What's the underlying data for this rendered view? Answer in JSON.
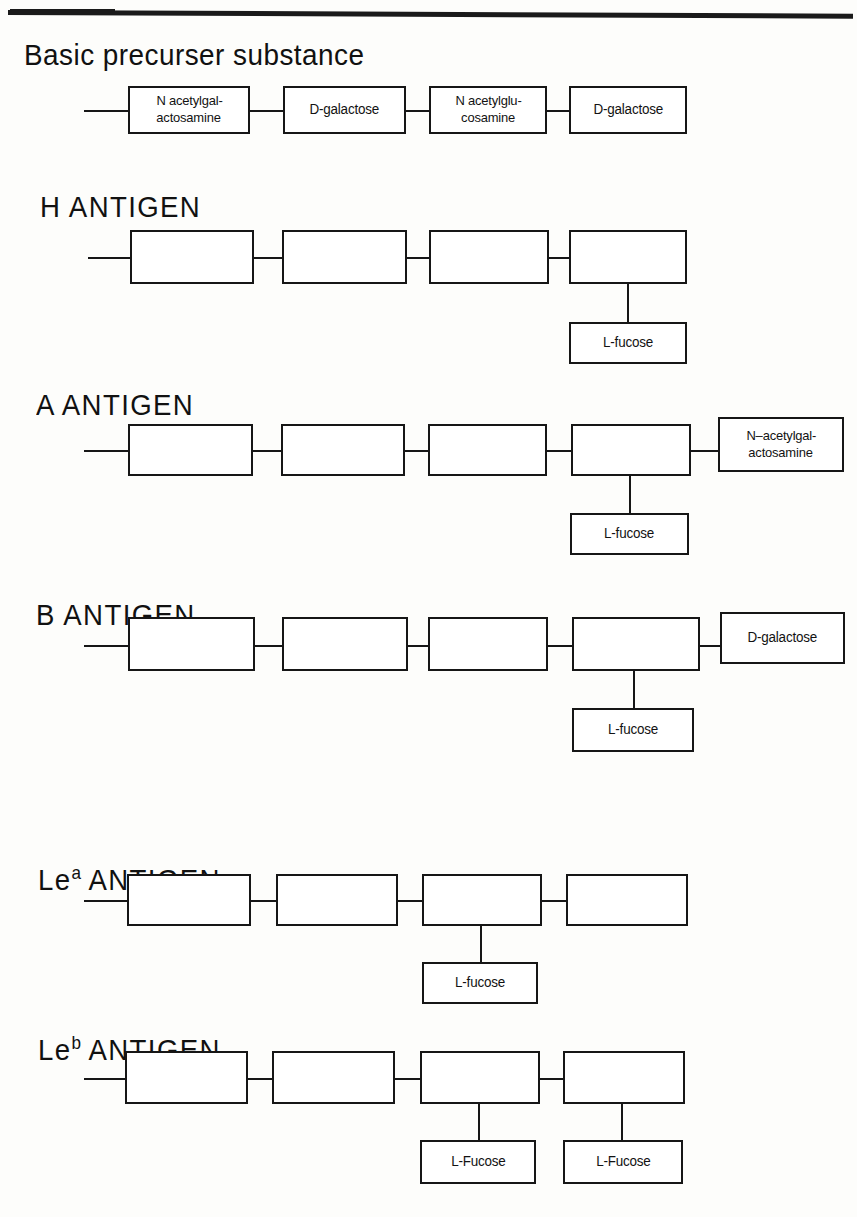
{
  "document": {
    "kind": "blood-group-antigen-structure-diagram"
  },
  "sections": [
    {
      "id": "basic-precursor",
      "title": "Basic precurser substance",
      "title_has_superscript": false,
      "chain": [
        {
          "lines": [
            "N acetylgal-",
            "actosamine"
          ]
        },
        {
          "lines": [
            "D-galactose"
          ]
        },
        {
          "lines": [
            "N acetylglu-",
            "cosamine"
          ]
        },
        {
          "lines": [
            "D-galactose"
          ]
        }
      ],
      "branch_below": null,
      "terminal_right": null
    },
    {
      "id": "h-antigen",
      "title": "H ANTIGEN",
      "title_has_superscript": false,
      "chain": [
        {
          "lines": [
            ""
          ]
        },
        {
          "lines": [
            ""
          ]
        },
        {
          "lines": [
            ""
          ]
        },
        {
          "lines": [
            ""
          ]
        }
      ],
      "branch_below": {
        "attached_to_box": 4,
        "label": "L-fucose"
      },
      "terminal_right": null
    },
    {
      "id": "a-antigen",
      "title": "A ANTIGEN",
      "title_has_superscript": false,
      "chain": [
        {
          "lines": [
            ""
          ]
        },
        {
          "lines": [
            ""
          ]
        },
        {
          "lines": [
            ""
          ]
        },
        {
          "lines": [
            ""
          ]
        }
      ],
      "branch_below": {
        "attached_to_box": 4,
        "label": "L-fucose"
      },
      "terminal_right": {
        "lines": [
          "N–acetylgal-",
          "actosamine"
        ]
      }
    },
    {
      "id": "b-antigen",
      "title": "B ANTIGEN",
      "title_has_superscript": false,
      "chain": [
        {
          "lines": [
            ""
          ]
        },
        {
          "lines": [
            ""
          ]
        },
        {
          "lines": [
            ""
          ]
        },
        {
          "lines": [
            ""
          ]
        }
      ],
      "branch_below": {
        "attached_to_box": 4,
        "label": "L-fucose"
      },
      "terminal_right": {
        "lines": [
          "D-galactose"
        ]
      }
    },
    {
      "id": "lewis-a-antigen",
      "title_prefix": "Le",
      "title_superscript": "a",
      "title_suffix": " ANTIGEN",
      "title_has_superscript": true,
      "chain": [
        {
          "lines": [
            ""
          ]
        },
        {
          "lines": [
            ""
          ]
        },
        {
          "lines": [
            ""
          ]
        },
        {
          "lines": [
            ""
          ]
        }
      ],
      "branch_below": {
        "attached_to_box": 3,
        "label": "L-fucose"
      },
      "terminal_right": null
    },
    {
      "id": "lewis-b-antigen",
      "title_prefix": "Le",
      "title_superscript": "b",
      "title_suffix": " ANTIGEN",
      "title_has_superscript": true,
      "chain": [
        {
          "lines": [
            ""
          ]
        },
        {
          "lines": [
            ""
          ]
        },
        {
          "lines": [
            ""
          ]
        },
        {
          "lines": [
            ""
          ]
        }
      ],
      "branches_below": [
        {
          "attached_to_box": 3,
          "label": "L-Fucose"
        },
        {
          "attached_to_box": 4,
          "label": "L-Fucose"
        }
      ],
      "terminal_right": null
    }
  ],
  "labels": {
    "basic_title": "Basic precurser substance",
    "h_title": "H ANTIGEN",
    "a_title": "A ANTIGEN",
    "b_title": "B ANTIGEN",
    "lea_prefix": "Le",
    "lea_sup": "a",
    "lea_suffix": " ANTIGEN",
    "leb_prefix": "Le",
    "leb_sup": "b",
    "leb_suffix": " ANTIGEN",
    "box_n_acetylgalactosamine_l1": "N acetylgal-",
    "box_n_acetylgalactosamine_l2": "actosamine",
    "box_d_galactose": "D-galactose",
    "box_n_acetylglucosamine_l1": "N acetylglu-",
    "box_n_acetylglucosamine_l2": "cosamine",
    "box_d_galactose_2": "D-galactose",
    "h_fucose": "L-fucose",
    "a_fucose": "L-fucose",
    "a_terminal_l1": "N–acetylgal-",
    "a_terminal_l2": "actosamine",
    "b_fucose": "L-fucose",
    "b_terminal": "D-galactose",
    "lea_fucose": "L-fucose",
    "leb_fucose_1": "L-Fucose",
    "leb_fucose_2": "L-Fucose"
  },
  "colors": {
    "ink": "#161616",
    "paper": "#fdfdfb"
  }
}
